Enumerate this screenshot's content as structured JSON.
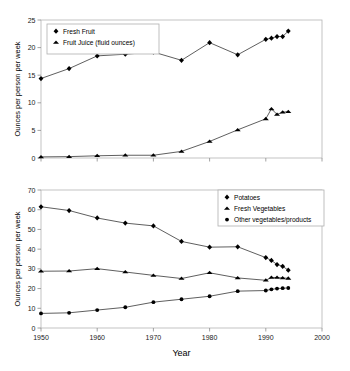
{
  "figure": {
    "background": "#ffffff",
    "marker_color": "#000000",
    "line_color": "#2a2a2a",
    "frame_color": "#b5b5b5"
  },
  "chart_data": [
    {
      "id": "top",
      "type": "line",
      "title": "",
      "xlabel": "",
      "ylabel": "Ounces per person per week",
      "xlim": [
        1950,
        2000
      ],
      "ylim": [
        0,
        25
      ],
      "xticks": [
        1950,
        1960,
        1970,
        1980,
        1990,
        2000
      ],
      "xticklabels": [
        "",
        "",
        "",
        "",
        "",
        ""
      ],
      "yticks": [
        0,
        5,
        10,
        15,
        20,
        25
      ],
      "yticklabels": [
        "0",
        "5",
        "10",
        "15",
        "20",
        "25"
      ],
      "grid": false,
      "legend_position": "upper-left",
      "series": [
        {
          "name": "Fresh Fruit",
          "marker": "diamond",
          "x": [
            1950,
            1955,
            1960,
            1965,
            1970,
            1975,
            1980,
            1985,
            1990,
            1991,
            1992,
            1993,
            1994
          ],
          "values": [
            14.4,
            16.2,
            18.5,
            18.8,
            19.2,
            17.7,
            20.9,
            18.7,
            21.5,
            21.7,
            22.0,
            22.0,
            23.0
          ]
        },
        {
          "name": "Fruit Juice (fluid ounces)",
          "marker": "triangle",
          "x": [
            1950,
            1955,
            1960,
            1965,
            1970,
            1975,
            1980,
            1985,
            1990,
            1991,
            1992,
            1993,
            1994
          ],
          "values": [
            0.2,
            0.25,
            0.4,
            0.5,
            0.5,
            1.2,
            3.0,
            5.1,
            7.1,
            8.9,
            7.9,
            8.3,
            8.4
          ]
        }
      ]
    },
    {
      "id": "bottom",
      "type": "line",
      "title": "",
      "xlabel": "Year",
      "ylabel": "Ounces per person per week",
      "xlim": [
        1950,
        2000
      ],
      "ylim": [
        0,
        70
      ],
      "xticks": [
        1950,
        1960,
        1970,
        1980,
        1990,
        2000
      ],
      "xticklabels": [
        "1950",
        "1960",
        "1970",
        "1980",
        "1990",
        "2000"
      ],
      "yticks": [
        0,
        10,
        20,
        30,
        40,
        50,
        60,
        70
      ],
      "yticklabels": [
        "0",
        "10",
        "20",
        "30",
        "40",
        "50",
        "60",
        "70"
      ],
      "grid": false,
      "legend_position": "upper-right",
      "series": [
        {
          "name": "Potatoes",
          "marker": "diamond",
          "x": [
            1950,
            1955,
            1960,
            1965,
            1970,
            1975,
            1980,
            1985,
            1990,
            1991,
            1992,
            1993,
            1994
          ],
          "values": [
            61.5,
            59.6,
            55.8,
            53.2,
            51.8,
            43.9,
            41.0,
            41.2,
            35.7,
            34.3,
            32.2,
            31.3,
            29.3
          ]
        },
        {
          "name": "Fresh Vegetables",
          "marker": "triangle",
          "x": [
            1950,
            1955,
            1960,
            1965,
            1970,
            1975,
            1980,
            1985,
            1990,
            1991,
            1992,
            1993,
            1994
          ],
          "values": [
            28.8,
            28.9,
            30.1,
            28.4,
            26.7,
            25.1,
            28.0,
            25.4,
            24.2,
            25.6,
            25.6,
            25.4,
            25.2
          ]
        },
        {
          "name": "Other vegetables/products",
          "marker": "circle",
          "x": [
            1950,
            1955,
            1960,
            1965,
            1970,
            1975,
            1980,
            1985,
            1990,
            1991,
            1992,
            1993,
            1994
          ],
          "values": [
            7.4,
            7.7,
            9.1,
            10.5,
            13.1,
            14.6,
            16.1,
            18.7,
            19.0,
            19.6,
            20.0,
            20.2,
            20.3
          ]
        }
      ]
    }
  ]
}
